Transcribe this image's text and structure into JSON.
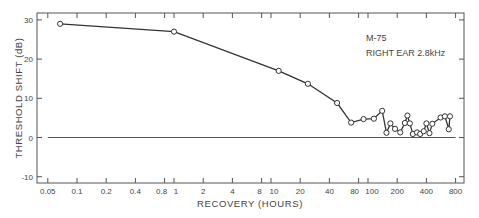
{
  "chart_data": {
    "type": "line",
    "title": "",
    "annotation": [
      "M-75",
      "RIGHT EAR 2.8kHz"
    ],
    "xlabel": "RECOVERY (HOURS)",
    "ylabel": "THRESHOLD SHIFT (dB)",
    "xscale": "log",
    "xlim": [
      0.04,
      900
    ],
    "ylim": [
      -12,
      32
    ],
    "x_ticks": [
      0.05,
      0.1,
      0.2,
      0.4,
      0.8,
      1,
      2,
      4,
      8,
      10,
      20,
      40,
      80,
      100,
      200,
      400,
      800
    ],
    "x_tick_labels": [
      "0.05",
      "0.1",
      "0.2",
      "0.4",
      "0.8",
      "1",
      "2",
      "4",
      "8",
      "10",
      "20",
      "40",
      "80",
      "100",
      "200",
      "400",
      "800"
    ],
    "y_ticks": [
      -10,
      0,
      10,
      20,
      30
    ],
    "y_tick_labels": [
      "-10",
      "0",
      "10",
      "20",
      "30"
    ],
    "grid": false,
    "reference_line": {
      "y": 0,
      "x_from": 0.05,
      "x_to": 800
    },
    "series": [
      {
        "name": "M-75 right ear 2.8kHz",
        "marker": "open-circle",
        "x": [
          0.067,
          1,
          12,
          24,
          48,
          67,
          90,
          115,
          140,
          155,
          170,
          190,
          215,
          240,
          255,
          270,
          290,
          320,
          345,
          375,
          400,
          430,
          460,
          560,
          620,
          680,
          700
        ],
        "y": [
          29,
          27,
          17,
          13.7,
          8.8,
          3.8,
          4.7,
          4.8,
          6.8,
          1.2,
          3.6,
          2.2,
          1.3,
          3.7,
          5.6,
          3.6,
          0.9,
          1.3,
          0.9,
          1.6,
          3.6,
          1.1,
          3.5,
          5.1,
          5.4,
          2.1,
          5.4
        ]
      }
    ]
  }
}
